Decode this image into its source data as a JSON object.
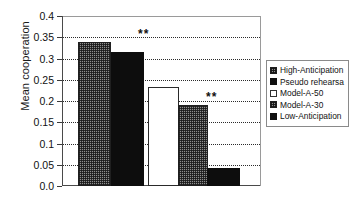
{
  "chart_data": {
    "type": "bar",
    "title": "",
    "xlabel": "",
    "ylabel": "Mean cooperation",
    "categories": [
      "High-Anticipation",
      "Pseudo rehearsa",
      "Model-A-50",
      "Model-A-30",
      "Low-Anticipation"
    ],
    "values": [
      0.34,
      0.315,
      0.233,
      0.19,
      0.043
    ],
    "ylim": [
      0.0,
      0.4
    ],
    "ytick_labels": [
      "0.4",
      "0.35",
      "0.3",
      "0.25",
      "0.2",
      "0.15",
      "0.1",
      "0.05",
      "0.0"
    ],
    "ytick_values": [
      0.4,
      0.35,
      0.3,
      0.25,
      0.2,
      0.15,
      0.1,
      0.05,
      0.0
    ],
    "grid": true,
    "grid_style": "dotted",
    "legend_position": "right",
    "bar_styles": [
      "hatched",
      "solid-black",
      "white",
      "hatched",
      "solid-black"
    ],
    "annotations": [
      {
        "text": "**",
        "at_y": 0.35,
        "between": [
          "High-Anticipation",
          "Model-A-50"
        ]
      },
      {
        "text": "**",
        "at_y": 0.205,
        "between": [
          "Model-A-30",
          "Low-Anticipation"
        ]
      }
    ]
  },
  "legend": {
    "items": [
      {
        "label": "High-Anticipation",
        "style": "hatched"
      },
      {
        "label": "Pseudo rehearsa",
        "style": "solid-black"
      },
      {
        "label": "Model-A-50",
        "style": "white"
      },
      {
        "label": "Model-A-30",
        "style": "hatched"
      },
      {
        "label": "Low-Anticipation",
        "style": "solid-black"
      }
    ]
  },
  "colors": {
    "axis": "#4a4a4a",
    "grid": "#2b2b2b",
    "bar_solid": "#0d0d0d",
    "bar_hatch": "#8e8e8e",
    "bar_white": "#ffffff",
    "text": "#111111"
  }
}
